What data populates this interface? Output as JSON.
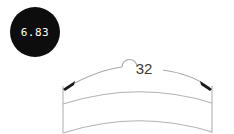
{
  "drawing": {
    "background_color": "#ffffff",
    "line_color": "#a8a8a8",
    "arrow_color": "#1a1a1a",
    "badge": {
      "name": "balloon-callout",
      "value": "6.83",
      "fill_color": "#0d0d0d",
      "text_color": "#ffffff",
      "center_x": 35,
      "center_y": 32,
      "radius": 25
    },
    "dimension": {
      "name": "arc-length-dimension",
      "value": "32",
      "text_color": "#3a3a3a",
      "label_x": 144,
      "label_y": 74,
      "has_left_arrowhead": true,
      "has_right_arrowhead": true,
      "has_jog": true
    },
    "part": {
      "name": "curved-part-outline",
      "left_extension_x": 63,
      "right_extension_x": 212,
      "outline_color": "#b0b0b0"
    }
  }
}
